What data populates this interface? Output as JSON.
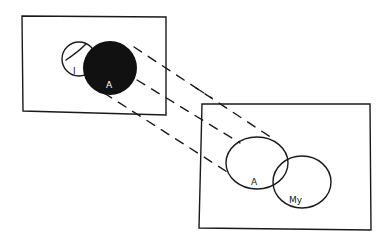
{
  "diagram": {
    "left_panel": {
      "small_circle_label": "I",
      "filled_circle_label": "A"
    },
    "right_panel": {
      "circle_a_label": "A",
      "circle_my_label": "My"
    },
    "colors": {
      "ink": "#1a1a1a",
      "paper": "#ffffff"
    }
  }
}
